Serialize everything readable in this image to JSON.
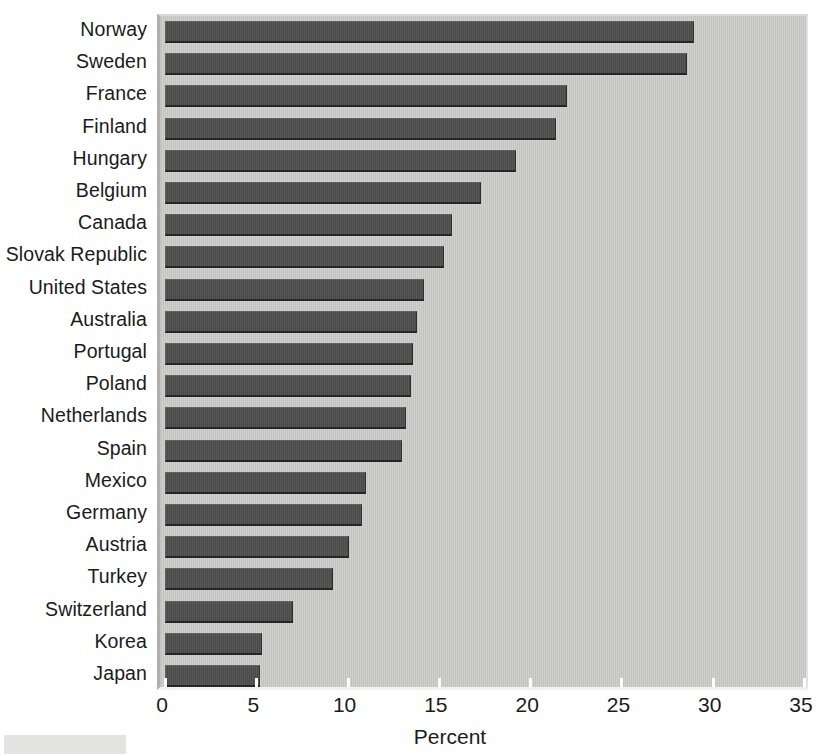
{
  "chart_data": {
    "type": "bar",
    "orientation": "horizontal",
    "title": "",
    "subtitle": "",
    "xlabel": "Percent",
    "ylabel": "",
    "xlim": [
      0,
      35
    ],
    "xticks": [
      0,
      5,
      10,
      15,
      20,
      25,
      30,
      35
    ],
    "xtick_labels": [
      "0",
      "5",
      "10",
      "15",
      "20",
      "25",
      "30",
      "35"
    ],
    "grid": false,
    "legend": null,
    "bar_color": "#4e4e4e",
    "plot_background_color": "#c9c9c7",
    "page_background_color": "#ffffff",
    "categories": [
      "Norway",
      "Sweden",
      "France",
      "Finland",
      "Hungary",
      "Belgium",
      "Canada",
      "Slovak Republic",
      "United States",
      "Australia",
      "Portugal",
      "Poland",
      "Netherlands",
      "Spain",
      "Mexico",
      "Germany",
      "Austria",
      "Turkey",
      "Switzerland",
      "Korea",
      "Japan"
    ],
    "values": [
      29.0,
      28.6,
      22.0,
      21.4,
      19.2,
      17.3,
      15.7,
      15.3,
      14.2,
      13.8,
      13.6,
      13.5,
      13.2,
      13.0,
      11.0,
      10.8,
      10.1,
      9.2,
      7.0,
      5.3,
      5.2
    ]
  }
}
